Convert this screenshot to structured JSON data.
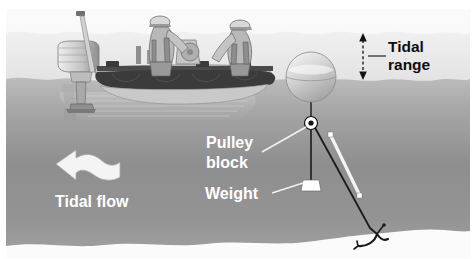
{
  "figure": {
    "kind": "illustration-diagram",
    "width": 476,
    "height": 259
  },
  "labels": {
    "tidal_range_line1": "Tidal",
    "tidal_range_line2": "range",
    "pulley_block_line1": "Pulley",
    "pulley_block_line2": "block",
    "weight": "Weight",
    "tidal_flow": "Tidal flow"
  },
  "annotations": [
    {
      "id": "tidal-range",
      "text": "Tidal range",
      "style": "black-on-white",
      "marker": "double-headed-dashed-arrow",
      "marker_x": 363,
      "marker_top_y": 34,
      "marker_bottom_y": 79
    },
    {
      "id": "pulley-block",
      "text": "Pulley block",
      "style": "white-on-water",
      "marker": "leader-line",
      "leader_from_x": 262,
      "leader_from_y": 152,
      "leader_to_x": 306,
      "leader_to_y": 126
    },
    {
      "id": "weight",
      "text": "Weight",
      "style": "white-on-water",
      "marker": "leader-line",
      "leader_from_x": 272,
      "leader_from_y": 192,
      "leader_to_x": 305,
      "leader_to_y": 183
    },
    {
      "id": "tidal-flow",
      "text": "Tidal flow",
      "style": "white-on-water",
      "marker": "wavy-arrow-pointing-left",
      "arrow_tip_x": 58,
      "arrow_tip_y": 165
    }
  ],
  "icons": [
    {
      "name": "boat-icon",
      "label": "inflatable-boat-with-two-crew",
      "x": 55,
      "y": 8,
      "w": 220,
      "h": 100
    },
    {
      "name": "outboard-motor-icon",
      "label": "outboard-motor",
      "x": 55,
      "y": 44,
      "w": 40,
      "h": 70
    },
    {
      "name": "buoy-icon",
      "label": "spherical-surface-buoy",
      "cx": 311,
      "cy": 77,
      "r": 26
    },
    {
      "name": "pulley-block-icon",
      "label": "pulley-block",
      "cx": 311,
      "cy": 123,
      "r": 7
    },
    {
      "name": "weight-icon",
      "label": "trapezoid-weight",
      "cx": 311,
      "cy": 185,
      "w": 18,
      "h": 12
    },
    {
      "name": "instrument-icon",
      "label": "white-current-meter-on-mooring-line",
      "x1": 330,
      "y1": 136,
      "x2": 361,
      "y2": 197
    },
    {
      "name": "anchor-icon",
      "label": "seabed-anchor",
      "x": 358,
      "y": 222,
      "w": 30,
      "h": 26
    },
    {
      "name": "mooring-line-icon",
      "label": "mooring-line-to-anchor"
    },
    {
      "name": "weight-line-icon",
      "label": "vertical-weight-line"
    },
    {
      "name": "wavy-arrow-icon",
      "label": "tidal-flow-arrow"
    },
    {
      "name": "dashed-arrow-icon",
      "label": "tidal-range-dimension-arrow"
    },
    {
      "name": "high-tide-waterline-icon",
      "label": "high-tide-wavy-water-surface"
    },
    {
      "name": "low-tide-waterline-icon",
      "label": "low-tide-wavy-water-surface"
    },
    {
      "name": "seabed-icon",
      "label": "seabed-profile"
    },
    {
      "name": "reflection-icon",
      "label": "boat-reflection-underwater"
    }
  ],
  "colors": {
    "page_background": "#ffffff",
    "sky": "#f3f3f3",
    "water_top": "#b4b4b4",
    "water_mid": "#8d8d8d",
    "water_bottom": "#9b9b9b",
    "seabed": "#fbfbfb",
    "label_dark": "#0d0d0d",
    "label_light": "#ffffff",
    "line_dark": "#1a1a1a",
    "boat_hull": "#3c3c3c",
    "boat_tube": "#d7d7d7"
  }
}
